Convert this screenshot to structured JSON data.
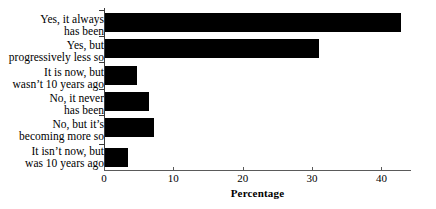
{
  "chart_data": {
    "type": "bar",
    "orientation": "horizontal",
    "title": "",
    "subtitle": "",
    "xlabel": "Percentage",
    "ylabel": "",
    "xlim": [
      0,
      47
    ],
    "xticks": [
      0,
      10,
      20,
      30,
      40
    ],
    "xtick_labels": [
      "0",
      "10",
      "20",
      "30",
      "40"
    ],
    "grid": false,
    "legend": false,
    "bar_color": "#000000",
    "axis_color": "#3a3a3a",
    "background": "#ffffff",
    "categories": [
      "Yes, it always\nhas been",
      "Yes, but\nprogressively less so",
      "It is now, but\nwasn’t 10 years ago",
      "No, it never\nhas been",
      "No, but it’s\nbecoming more so",
      "It isn’t now, but\nwas 10 years ago"
    ],
    "values": [
      42.8,
      31.0,
      4.7,
      6.5,
      7.2,
      3.5
    ]
  }
}
